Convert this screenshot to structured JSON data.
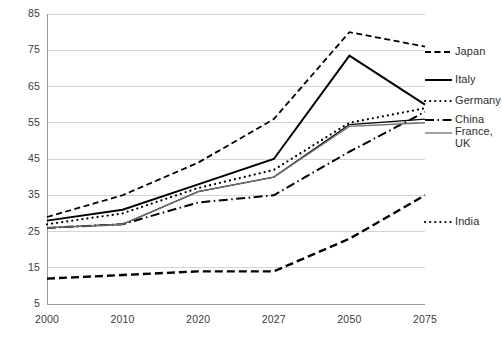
{
  "chart_data": {
    "type": "line",
    "title": "",
    "xlabel": "",
    "ylabel": "",
    "x": [
      2000,
      2010,
      2020,
      2027,
      2050,
      2075
    ],
    "categories": [
      "2000",
      "2010",
      "2020",
      "2027",
      "2050",
      "2075"
    ],
    "ylim": [
      5,
      85
    ],
    "yticks": [
      5,
      15,
      25,
      35,
      45,
      55,
      65,
      75,
      85
    ],
    "grid": true,
    "legend_position": "right-inline",
    "series": [
      {
        "name": "Japan",
        "values": [
          29,
          35,
          44,
          56,
          80,
          76
        ],
        "style": "dashed",
        "width": 1.8
      },
      {
        "name": "Italy",
        "values": [
          28,
          31,
          38,
          45,
          73.5,
          60
        ],
        "style": "solid",
        "width": 2.0
      },
      {
        "name": "Germany",
        "values": [
          27,
          30,
          37,
          42,
          55,
          59
        ],
        "style": "dotted",
        "width": 2.2
      },
      {
        "name": "China",
        "values": [
          26,
          27,
          33,
          35,
          47,
          58
        ],
        "style": "dash-dot",
        "width": 2.0
      },
      {
        "name": "France",
        "values": [
          26,
          27,
          36,
          40,
          54.5,
          56
        ],
        "style": "solid-thin",
        "width": 1.3
      },
      {
        "name": "UK",
        "values": [
          26,
          27,
          36,
          40,
          54,
          55
        ],
        "style": "solid-gray",
        "width": 1.3
      },
      {
        "name": "India",
        "values": [
          12,
          13,
          14,
          14,
          23,
          35
        ],
        "style": "dashed-bold",
        "width": 2.4
      }
    ]
  },
  "ytick_labels": [
    "85",
    "75",
    "65",
    "55",
    "45",
    "35",
    "25",
    "15",
    "5"
  ],
  "xtick_labels": [
    "2000",
    "2010",
    "2020",
    "2027",
    "2050",
    "2075"
  ],
  "legend": {
    "items": [
      {
        "label": "Japan"
      },
      {
        "label": "Italy"
      },
      {
        "label": "Germany"
      },
      {
        "label": "China"
      },
      {
        "label": "France,"
      },
      {
        "label": "UK"
      },
      {
        "label": "India"
      }
    ]
  },
  "colors": {
    "line": "#000000",
    "grid": "#d4d4d4",
    "axis": "#9a9a9a",
    "text": "#3b3b3b",
    "gray_line": "#6f6f6f"
  }
}
